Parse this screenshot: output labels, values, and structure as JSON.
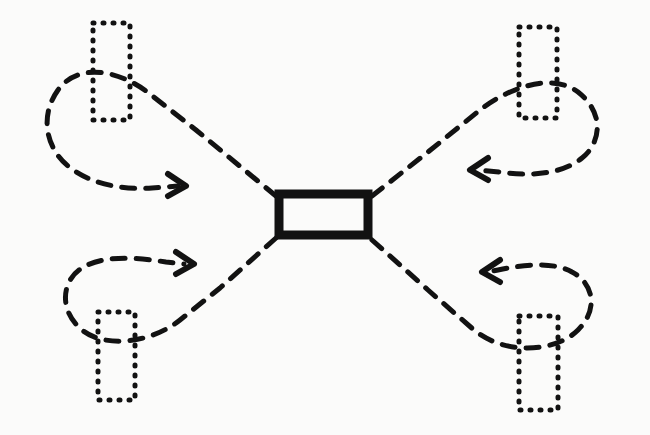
{
  "figure": {
    "background_color": "#fbfbfa",
    "ink_color": "#121212",
    "width": 650,
    "height": 435
  },
  "center_node": {
    "label": "",
    "shape": "rectangle",
    "style": "solid-thick",
    "stroke_width": 9,
    "x": 279,
    "y": 194,
    "width": 89,
    "height": 41
  },
  "corner_nodes": [
    {
      "id": "node-top-left",
      "label": "",
      "shape": "rectangle",
      "style": "dotted",
      "stroke_width": 5,
      "dash": "1 9",
      "x": 93,
      "y": 23,
      "width": 37,
      "height": 97
    },
    {
      "id": "node-top-right",
      "label": "",
      "shape": "rectangle",
      "style": "dotted",
      "stroke_width": 5,
      "dash": "1 9",
      "x": 519,
      "y": 27,
      "width": 38,
      "height": 91
    },
    {
      "id": "node-bottom-left",
      "label": "",
      "shape": "rectangle",
      "style": "dotted",
      "stroke_width": 5,
      "dash": "1 9",
      "x": 98,
      "y": 312,
      "width": 37,
      "height": 88
    },
    {
      "id": "node-bottom-right",
      "label": "",
      "shape": "rectangle",
      "style": "dotted",
      "stroke_width": 5,
      "dash": "1 9",
      "x": 519,
      "y": 316,
      "width": 39,
      "height": 94
    }
  ],
  "flows": [
    {
      "id": "flow-top-left",
      "from": "center_node",
      "to": "node-top-left",
      "direction": "counterclockwise-loop",
      "arrow_direction": "right",
      "style": "dashed",
      "stroke_width": 5,
      "dash": "13 11",
      "path": "M 276 196 L 196 130 L 150 94 C 120 70 78 62 58 90 C 38 118 48 150 68 166 C 92 186 128 190 152 188 L 178 186",
      "arrow": "M 168 174 L 186 186 L 168 196"
    },
    {
      "id": "flow-top-right",
      "from": "center_node",
      "to": "node-top-right",
      "direction": "clockwise-loop",
      "arrow_direction": "left",
      "style": "dashed",
      "stroke_width": 5,
      "dash": "13 11",
      "path": "M 372 196 L 428 152 L 480 110 C 508 88 552 72 578 92 C 606 114 600 144 582 158 C 560 176 524 176 500 172 L 476 170",
      "arrow": "M 488 158 L 470 170 L 488 180"
    },
    {
      "id": "flow-bottom-left",
      "from": "center_node",
      "to": "node-bottom-left",
      "direction": "counterclockwise-loop",
      "arrow_direction": "right",
      "style": "dashed",
      "stroke_width": 5,
      "dash": "13 11",
      "path": "M 276 238 L 220 288 L 180 320 C 150 344 104 348 82 330 C 58 310 62 280 82 268 C 104 254 140 258 166 262 L 184 264",
      "arrow": "M 176 252 L 194 264 L 176 274"
    },
    {
      "id": "flow-bottom-right",
      "from": "center_node",
      "to": "node-bottom-right",
      "direction": "clockwise-loop",
      "arrow_direction": "left",
      "style": "dashed",
      "stroke_width": 5,
      "dash": "13 11",
      "path": "M 372 240 L 428 290 L 474 330 C 506 356 556 352 578 330 C 600 308 592 282 572 272 C 550 260 518 266 498 270 L 488 272",
      "arrow": "M 500 260 L 482 272 L 500 282"
    }
  ]
}
